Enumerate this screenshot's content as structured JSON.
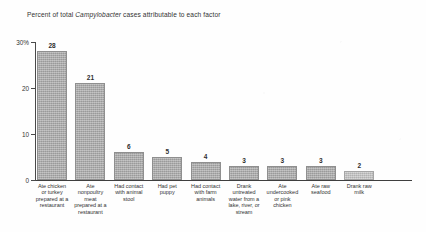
{
  "chart_data": {
    "type": "bar",
    "title": "Percent of total Campylobacter cases attributable to each factor",
    "title_parts": {
      "before": "Percent of total ",
      "italic": "Campylobacter",
      "after": " cases attributable to each factor"
    },
    "xlabel": "",
    "ylabel": "",
    "ylim": [
      0,
      30
    ],
    "yticks": [
      0,
      10,
      20,
      30
    ],
    "ytick_labels": [
      "0",
      "10",
      "20",
      "30%"
    ],
    "grid": false,
    "legend": null,
    "bar_color": "#a9a9a9",
    "categories": [
      "Ate chicken or turkey prepared at a restaurant",
      "Ate nonpoultry meat prepared at a restaurant",
      "Had contact with animal stool",
      "Had pet puppy",
      "Had contact with farm animals",
      "Drank untreated water from a lake, river, or stream",
      "Ate undercooked or pink chicken",
      "Ate raw seafood",
      "Drank raw milk"
    ],
    "values": [
      28,
      21,
      6,
      5,
      4,
      3,
      3,
      3,
      2
    ],
    "data_labels": [
      "28",
      "21",
      "6",
      "5",
      "4",
      "3",
      "3",
      "3",
      "2"
    ],
    "category_label_lines": [
      [
        "Ate chicken",
        "or turkey",
        "prepared at a",
        "restaurant"
      ],
      [
        "Ate",
        "nonpoultry",
        "meat",
        "prepared at a",
        "restaurant"
      ],
      [
        "Had contact",
        "with animal",
        "stool"
      ],
      [
        "Had pet",
        "puppy"
      ],
      [
        "Had contact",
        "with farm",
        "animals"
      ],
      [
        "Drank",
        "untreated",
        "water from a",
        "lake, river, or",
        "stream"
      ],
      [
        "Ate",
        "undercooked",
        "or pink",
        "chicken"
      ],
      [
        "Ate raw",
        "seafood"
      ],
      [
        "Drank raw",
        "milk"
      ]
    ]
  }
}
